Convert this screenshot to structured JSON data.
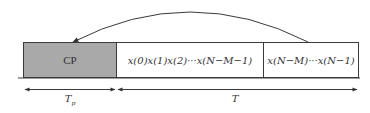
{
  "diagram": {
    "blocks": [
      {
        "id": "cp",
        "label": "CP",
        "fill": "#a9a9a9"
      },
      {
        "id": "body",
        "label": "x(0)x(1)x(2)···x(N−M−1)",
        "fill": "#ffffff"
      },
      {
        "id": "tail",
        "label": "x(N−M)···x(N−1)",
        "fill": "#ffffff"
      }
    ],
    "copy_arrow": {
      "from": "tail",
      "to": "cp",
      "meaning": "tail samples copied to cyclic prefix"
    },
    "dimensions": [
      {
        "id": "tp",
        "symbol": "T",
        "subscript": "p",
        "spans": "cp"
      },
      {
        "id": "t",
        "symbol": "T",
        "subscript": "",
        "spans": "body+tail"
      }
    ],
    "colors": {
      "stroke": "#3a3a3a",
      "cp_fill": "#a9a9a9",
      "background": "#ffffff"
    }
  }
}
